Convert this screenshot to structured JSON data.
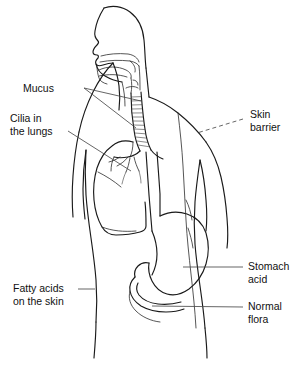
{
  "figure": {
    "view": "human torso, head in left profile, back three-quarter view",
    "background_color": "#ffffff",
    "line_color": "#1a1a1a",
    "leader_color": "#4a4a4a"
  },
  "labels": [
    {
      "id": "mucus",
      "text": "Mucus",
      "lines": [
        "Mucus"
      ],
      "side": "left",
      "leader_style": "solid-forked",
      "points_to": "nasal cavity and oral/pharyngeal mucosa"
    },
    {
      "id": "cilia",
      "text": "Cilia in the lungs",
      "lines": [
        "Cilia in",
        "the lungs"
      ],
      "side": "left",
      "leader_style": "solid",
      "points_to": "bronchi inside the lung"
    },
    {
      "id": "skin-barrier",
      "text": "Skin barrier",
      "lines": [
        "Skin",
        "barrier"
      ],
      "side": "right",
      "leader_style": "dashed",
      "points_to": "shoulder and upper back skin surface"
    },
    {
      "id": "stomach-acid",
      "text": "Stomach acid",
      "lines": [
        "Stomach",
        "acid"
      ],
      "side": "right",
      "leader_style": "solid",
      "points_to": "stomach body"
    },
    {
      "id": "normal-flora",
      "text": "Normal flora",
      "lines": [
        "Normal",
        "flora"
      ],
      "side": "right",
      "leader_style": "solid",
      "points_to": "intestine below the stomach"
    },
    {
      "id": "fatty-acids",
      "text": "Fatty acids on the skin",
      "lines": [
        "Fatty acids",
        "on the skin"
      ],
      "side": "left",
      "leader_style": "solid",
      "points_to": "left flank skin surface"
    }
  ],
  "anatomy_parts": [
    "head-profile",
    "nasal-cavity",
    "tongue",
    "oral-cavity",
    "pharynx",
    "trachea-with-cartilage-rings",
    "left-lung",
    "bronchial-tree",
    "esophagus",
    "stomach",
    "intestine",
    "torso-outline",
    "right-arm",
    "left-arm",
    "spine-line"
  ]
}
